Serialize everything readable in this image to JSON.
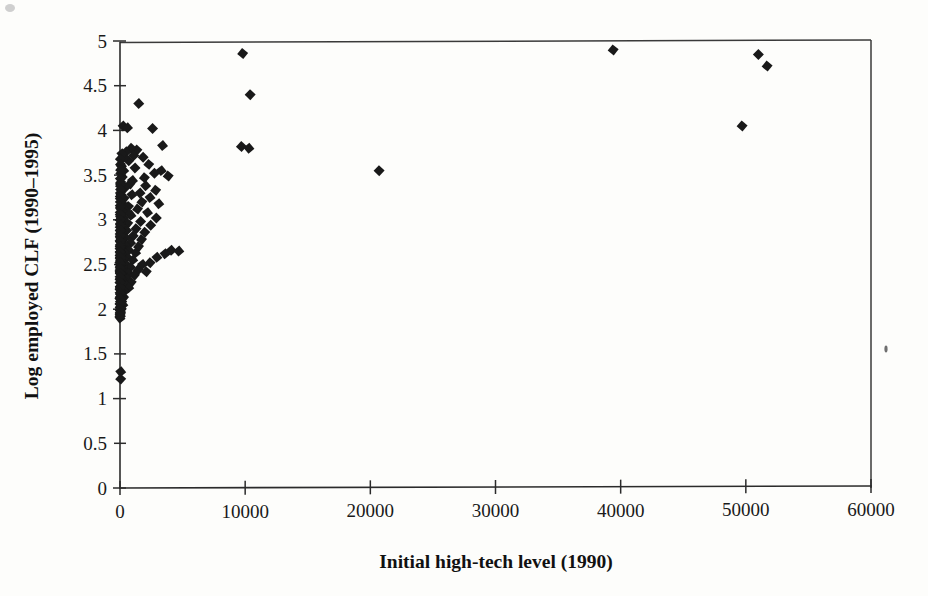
{
  "figure": {
    "background_color": "#fdfdfb",
    "marker_color": "#191919",
    "axis_color": "#2b2b2b"
  },
  "chart_data": {
    "type": "scatter",
    "title": "",
    "subtitle": "",
    "xlabel": "Initial high-tech level (1990)",
    "ylabel": "Log employed CLF (1990–1995)",
    "xlim": [
      0,
      60000
    ],
    "ylim": [
      0,
      5
    ],
    "xticks": [
      0,
      10000,
      20000,
      30000,
      40000,
      50000,
      60000
    ],
    "xticklabels": [
      "0",
      "10000",
      "20000",
      "30000",
      "40000",
      "50000",
      "60000"
    ],
    "yticks": [
      0,
      0.5,
      1,
      1.5,
      2,
      2.5,
      3,
      3.5,
      4,
      4.5,
      5
    ],
    "yticklabels": [
      "0",
      "0.5",
      "1",
      "1.5",
      "2",
      "2.5",
      "3",
      "3.5",
      "4",
      "4.5",
      "5"
    ],
    "grid": false,
    "legend": null,
    "legend_position": "none",
    "marker_shape": "diamond",
    "marker_size": 11,
    "series": [
      {
        "name": "Metropolitan areas",
        "points": [
          [
            9800,
            4.86
          ],
          [
            10400,
            4.4
          ],
          [
            9700,
            3.82
          ],
          [
            10300,
            3.8
          ],
          [
            20700,
            3.55
          ],
          [
            39400,
            4.9
          ],
          [
            49700,
            4.05
          ],
          [
            51000,
            4.85
          ],
          [
            51700,
            4.72
          ],
          [
            1500,
            4.3
          ],
          [
            250,
            4.05
          ],
          [
            600,
            4.03
          ],
          [
            2600,
            4.02
          ],
          [
            3400,
            3.83
          ],
          [
            1350,
            3.78
          ],
          [
            900,
            3.8
          ],
          [
            500,
            3.76
          ],
          [
            1100,
            3.72
          ],
          [
            1850,
            3.7
          ],
          [
            2300,
            3.62
          ],
          [
            3300,
            3.55
          ],
          [
            3850,
            3.49
          ],
          [
            2750,
            3.52
          ],
          [
            1950,
            3.47
          ],
          [
            1200,
            3.58
          ],
          [
            700,
            3.66
          ],
          [
            350,
            3.7
          ],
          [
            150,
            3.74
          ],
          [
            2050,
            3.38
          ],
          [
            2850,
            3.33
          ],
          [
            1600,
            3.3
          ],
          [
            800,
            3.4
          ],
          [
            300,
            3.55
          ],
          [
            120,
            3.6
          ],
          [
            1000,
            3.44
          ],
          [
            2400,
            3.25
          ],
          [
            3100,
            3.18
          ],
          [
            1750,
            3.2
          ],
          [
            950,
            3.28
          ],
          [
            420,
            3.36
          ],
          [
            180,
            3.48
          ],
          [
            60,
            3.52
          ],
          [
            1400,
            3.12
          ],
          [
            2200,
            3.08
          ],
          [
            2900,
            3.02
          ],
          [
            680,
            3.15
          ],
          [
            330,
            3.24
          ],
          [
            140,
            3.34
          ],
          [
            55,
            3.42
          ],
          [
            1650,
            2.98
          ],
          [
            2450,
            2.94
          ],
          [
            880,
            3.05
          ],
          [
            460,
            3.1
          ],
          [
            210,
            3.18
          ],
          [
            90,
            3.28
          ],
          [
            40,
            3.38
          ],
          [
            1280,
            2.9
          ],
          [
            1980,
            2.86
          ],
          [
            620,
            2.96
          ],
          [
            310,
            3.02
          ],
          [
            150,
            3.1
          ],
          [
            70,
            3.2
          ],
          [
            30,
            3.3
          ],
          [
            1050,
            2.82
          ],
          [
            1720,
            2.78
          ],
          [
            530,
            2.88
          ],
          [
            260,
            2.94
          ],
          [
            120,
            3.02
          ],
          [
            55,
            3.12
          ],
          [
            25,
            3.24
          ],
          [
            850,
            2.74
          ],
          [
            1480,
            2.7
          ],
          [
            440,
            2.8
          ],
          [
            220,
            2.86
          ],
          [
            100,
            2.94
          ],
          [
            45,
            3.04
          ],
          [
            20,
            3.16
          ],
          [
            700,
            2.66
          ],
          [
            1250,
            2.63
          ],
          [
            370,
            2.72
          ],
          [
            180,
            2.78
          ],
          [
            85,
            2.86
          ],
          [
            38,
            2.96
          ],
          [
            16,
            3.08
          ],
          [
            4100,
            2.66
          ],
          [
            4700,
            2.65
          ],
          [
            3600,
            2.62
          ],
          [
            2950,
            2.58
          ],
          [
            580,
            2.58
          ],
          [
            1020,
            2.55
          ],
          [
            300,
            2.64
          ],
          [
            145,
            2.7
          ],
          [
            70,
            2.78
          ],
          [
            32,
            2.88
          ],
          [
            14,
            3.0
          ],
          [
            2400,
            2.52
          ],
          [
            1800,
            2.5
          ],
          [
            480,
            2.5
          ],
          [
            840,
            2.47
          ],
          [
            245,
            2.56
          ],
          [
            118,
            2.62
          ],
          [
            58,
            2.7
          ],
          [
            26,
            2.8
          ],
          [
            12,
            2.92
          ],
          [
            1450,
            2.44
          ],
          [
            2100,
            2.42
          ],
          [
            390,
            2.43
          ],
          [
            690,
            2.4
          ],
          [
            200,
            2.48
          ],
          [
            95,
            2.54
          ],
          [
            46,
            2.62
          ],
          [
            21,
            2.72
          ],
          [
            10,
            2.84
          ],
          [
            1150,
            2.38
          ],
          [
            320,
            2.36
          ],
          [
            560,
            2.34
          ],
          [
            165,
            2.41
          ],
          [
            78,
            2.47
          ],
          [
            38,
            2.55
          ],
          [
            17,
            2.64
          ],
          [
            8,
            2.76
          ],
          [
            900,
            2.3
          ],
          [
            260,
            2.29
          ],
          [
            450,
            2.27
          ],
          [
            135,
            2.34
          ],
          [
            64,
            2.4
          ],
          [
            31,
            2.48
          ],
          [
            14,
            2.57
          ],
          [
            6,
            2.68
          ],
          [
            700,
            2.24
          ],
          [
            210,
            2.22
          ],
          [
            360,
            2.2
          ],
          [
            110,
            2.27
          ],
          [
            52,
            2.33
          ],
          [
            25,
            2.41
          ],
          [
            11,
            2.5
          ],
          [
            5,
            2.6
          ],
          [
            170,
            2.15
          ],
          [
            290,
            2.13
          ],
          [
            90,
            2.19
          ],
          [
            42,
            2.25
          ],
          [
            20,
            2.33
          ],
          [
            9,
            2.42
          ],
          [
            4,
            2.52
          ],
          [
            140,
            2.08
          ],
          [
            230,
            2.05
          ],
          [
            72,
            2.11
          ],
          [
            34,
            2.17
          ],
          [
            16,
            2.25
          ],
          [
            7,
            2.34
          ],
          [
            3,
            2.44
          ],
          [
            110,
            2.0
          ],
          [
            58,
            2.03
          ],
          [
            28,
            2.08
          ],
          [
            13,
            2.14
          ],
          [
            6,
            2.22
          ],
          [
            3,
            2.3
          ],
          [
            45,
            1.96
          ],
          [
            22,
            1.98
          ],
          [
            10,
            2.02
          ],
          [
            5,
            2.06
          ],
          [
            2,
            2.12
          ],
          [
            18,
            1.92
          ],
          [
            8,
            1.94
          ],
          [
            4,
            1.9
          ],
          [
            30,
            3.68
          ],
          [
            38,
            3.62
          ],
          [
            48,
            3.56
          ],
          [
            26,
            3.46
          ],
          [
            35,
            3.4
          ],
          [
            44,
            3.34
          ],
          [
            22,
            3.26
          ],
          [
            29,
            3.2
          ],
          [
            37,
            3.14
          ],
          [
            19,
            3.06
          ],
          [
            24,
            3.0
          ],
          [
            31,
            2.94
          ],
          [
            15,
            2.88
          ],
          [
            20,
            2.82
          ],
          [
            27,
            2.76
          ],
          [
            12,
            2.7
          ],
          [
            17,
            2.64
          ],
          [
            23,
            2.58
          ],
          [
            9,
            2.52
          ],
          [
            14,
            2.46
          ],
          [
            19,
            2.4
          ],
          [
            7,
            2.36
          ],
          [
            11,
            2.3
          ],
          [
            16,
            2.24
          ],
          [
            6,
            2.18
          ],
          [
            10,
            2.12
          ],
          [
            13,
            2.06
          ],
          [
            5,
            2.0
          ],
          [
            8,
            1.96
          ],
          [
            3,
            1.92
          ],
          [
            60,
            1.3
          ],
          [
            55,
            1.22
          ]
        ]
      }
    ]
  },
  "artifacts": {
    "speck_note": "scan-speck"
  }
}
